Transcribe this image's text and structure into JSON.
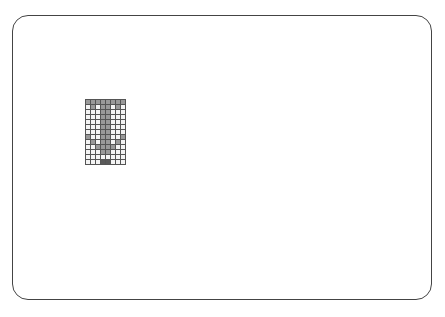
{
  "canvas": {
    "width": 445,
    "height": 317,
    "background": "#ffffff"
  },
  "frame": {
    "border_color": "#444444",
    "radius": 16
  },
  "pixel_grid": {
    "cols": 8,
    "rows": 13,
    "cell_size": 5,
    "line_color": "#555555",
    "colors": {
      "0": "#f4f4f4",
      "1": "#9a9a9a",
      "2": "#5a5a5a"
    },
    "cells": [
      [
        1,
        1,
        1,
        1,
        1,
        1,
        1,
        1
      ],
      [
        0,
        1,
        0,
        1,
        1,
        0,
        1,
        0
      ],
      [
        0,
        0,
        0,
        1,
        1,
        0,
        0,
        0
      ],
      [
        0,
        0,
        0,
        1,
        1,
        0,
        0,
        0
      ],
      [
        0,
        0,
        0,
        1,
        1,
        0,
        0,
        0
      ],
      [
        0,
        0,
        0,
        1,
        1,
        0,
        0,
        0
      ],
      [
        0,
        0,
        0,
        1,
        1,
        0,
        0,
        0
      ],
      [
        1,
        0,
        0,
        1,
        1,
        0,
        0,
        1
      ],
      [
        0,
        1,
        0,
        1,
        1,
        0,
        1,
        0
      ],
      [
        0,
        0,
        1,
        1,
        1,
        1,
        0,
        0
      ],
      [
        0,
        0,
        0,
        1,
        1,
        0,
        0,
        0
      ],
      [
        0,
        0,
        0,
        0,
        0,
        0,
        0,
        0
      ],
      [
        0,
        0,
        0,
        2,
        2,
        0,
        0,
        0
      ]
    ]
  }
}
